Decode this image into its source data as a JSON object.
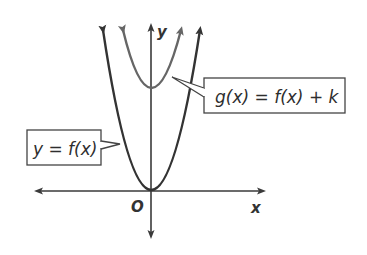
{
  "diagram": {
    "type": "graph-transformation",
    "axes": {
      "x_label": "x",
      "y_label": "y",
      "origin_label": "O"
    },
    "curves": [
      {
        "id": "f",
        "label": "y = f(x)",
        "vertex": [
          0,
          0
        ],
        "color": "#333333"
      },
      {
        "id": "g",
        "label": "g(x) = f(x) + k",
        "vertex": [
          0,
          "k"
        ],
        "color": "#666666"
      }
    ],
    "callouts": {
      "f": "y = f(x)",
      "g": "g(x) = f(x) + k"
    }
  }
}
